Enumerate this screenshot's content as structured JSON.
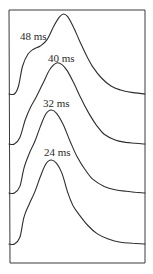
{
  "chart_data": {
    "type": "line",
    "title": "",
    "xlabel": "",
    "ylabel": "",
    "grid": false,
    "legend": "none",
    "annotations": [
      "48 ms",
      "40 ms",
      "32 ms",
      "24 ms"
    ],
    "x_domain": [
      0,
      1
    ],
    "y_domain_per_trace": [
      0,
      1
    ],
    "series": [
      {
        "name": "48 ms",
        "label": "48 ms",
        "offset_rank": 0,
        "x": [
          0.0,
          0.04,
          0.07,
          0.1,
          0.14,
          0.18,
          0.23,
          0.28,
          0.33,
          0.37,
          0.4,
          0.43,
          0.47,
          0.52,
          0.57,
          0.62,
          0.68,
          0.75,
          0.82,
          0.9,
          1.0
        ],
        "y": [
          0.0,
          0.0,
          0.1,
          0.35,
          0.5,
          0.56,
          0.6,
          0.68,
          0.85,
          0.96,
          1.0,
          0.97,
          0.85,
          0.66,
          0.48,
          0.33,
          0.2,
          0.1,
          0.05,
          0.02,
          0.0
        ]
      },
      {
        "name": "40 ms",
        "label": "40 ms",
        "offset_rank": 1,
        "x": [
          0.0,
          0.04,
          0.08,
          0.12,
          0.16,
          0.2,
          0.25,
          0.3,
          0.35,
          0.39,
          0.43,
          0.48,
          0.53,
          0.58,
          0.64,
          0.7,
          0.78,
          0.86,
          0.93,
          1.0
        ],
        "y": [
          0.0,
          0.0,
          0.08,
          0.3,
          0.46,
          0.58,
          0.75,
          0.92,
          1.0,
          0.98,
          0.9,
          0.74,
          0.56,
          0.4,
          0.24,
          0.12,
          0.05,
          0.02,
          0.01,
          0.0
        ]
      },
      {
        "name": "32 ms",
        "label": "32 ms",
        "offset_rank": 2,
        "x": [
          0.0,
          0.04,
          0.08,
          0.11,
          0.15,
          0.19,
          0.23,
          0.27,
          0.31,
          0.35,
          0.4,
          0.45,
          0.5,
          0.56,
          0.62,
          0.7,
          0.78,
          0.86,
          0.93,
          1.0
        ],
        "y": [
          0.0,
          0.0,
          0.08,
          0.3,
          0.48,
          0.62,
          0.8,
          0.95,
          1.0,
          0.96,
          0.82,
          0.62,
          0.44,
          0.28,
          0.16,
          0.08,
          0.04,
          0.02,
          0.01,
          0.0
        ]
      },
      {
        "name": "24 ms",
        "label": "24 ms",
        "offset_rank": 3,
        "x": [
          0.0,
          0.04,
          0.08,
          0.11,
          0.15,
          0.19,
          0.23,
          0.27,
          0.31,
          0.35,
          0.39,
          0.43,
          0.47,
          0.52,
          0.58,
          0.65,
          0.73,
          0.82,
          0.91,
          1.0
        ],
        "y": [
          0.0,
          0.0,
          0.08,
          0.32,
          0.48,
          0.62,
          0.8,
          0.95,
          1.0,
          0.96,
          0.84,
          0.62,
          0.46,
          0.34,
          0.22,
          0.12,
          0.06,
          0.02,
          0.01,
          0.0
        ]
      }
    ]
  }
}
